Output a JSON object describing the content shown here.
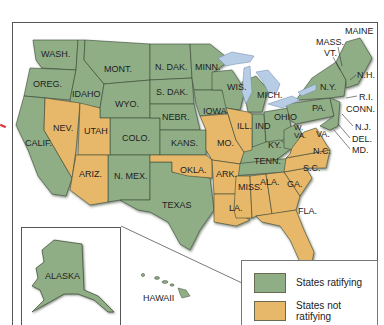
{
  "colors": {
    "ratifying": "#8fae86",
    "not_ratifying": "#e8b86a",
    "border": "#3a4a35",
    "water": "#b7cde6"
  },
  "states": {
    "wash": "WASH.",
    "oreg": "OREG.",
    "calif": "CALIF.",
    "idaho": "IDAHO",
    "nev": "NEV.",
    "utah": "UTAH",
    "ariz": "ARIZ.",
    "mont": "MONT.",
    "wyo": "WYO.",
    "colo": "COLO.",
    "nmex": "N. MEX.",
    "ndak": "N. DAK.",
    "sdak": "S. DAK.",
    "nebr": "NEBR.",
    "kans": "KANS.",
    "okla": "OKLA.",
    "texas": "TEXAS",
    "minn": "MINN.",
    "iowa": "IOWA",
    "mo": "MO.",
    "ark": "ARK.",
    "la": "LA.",
    "wis": "WIS.",
    "ill": "ILL.",
    "mich": "MICH.",
    "ind": "IND",
    "ohio": "OHIO",
    "ky": "KY.",
    "tenn": "TENN.",
    "miss": "MISS.",
    "ala": "ALA.",
    "ga": "GA.",
    "fla": "FLA.",
    "sc": "S.C.",
    "nc": "N.C.",
    "va": "VA.",
    "wva": "W. VA.",
    "pa": "PA.",
    "ny": "N.Y.",
    "vt": "VT.",
    "mass": "MASS.",
    "maine": "MAINE",
    "nh": "N.H.",
    "ri": "R.I.",
    "conn": "CONN.",
    "nj": "N.J.",
    "del": "DEL.",
    "md": "MD.",
    "alaska": "ALASKA",
    "hawaii": "HAWAII"
  },
  "legend": {
    "items": [
      {
        "label": "States ratifying",
        "status": "ratifying"
      },
      {
        "label_line1": "States not",
        "label_line2": "ratifying",
        "status": "not_ratifying"
      }
    ]
  }
}
